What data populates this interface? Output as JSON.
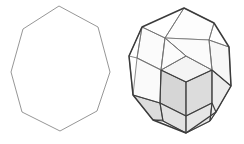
{
  "figure": {
    "background_color": "#ffffff",
    "width": 244,
    "height": 144,
    "panels": [
      {
        "id": "left-panel",
        "name": "octagon-outline",
        "label": "Regular octagon outline",
        "type": "polygon-2d",
        "sides": 8,
        "stroke_color": "#8a8a8a",
        "fill_color": "none",
        "stroke_width": 0.9,
        "vertices": [
          [
            59,
            6
          ],
          [
            98,
            27
          ],
          [
            110,
            72
          ],
          [
            97,
            111
          ],
          [
            60,
            131
          ],
          [
            22,
            112
          ],
          [
            11,
            72
          ],
          [
            23,
            29
          ]
        ]
      },
      {
        "id": "right-panel",
        "name": "zonohedron-3d",
        "label": "Shaded zonohedron wireframe",
        "type": "polyhedron-3d",
        "silhouette_color": "#3b3b3b",
        "edge_color": "#3d3d3d",
        "hidden_edge_color": "#9d9d9d",
        "shaded_face_color": "#d9d9d9",
        "light_face_color": "#f2f2f2",
        "white_face_color": "#ffffff",
        "silhouette": [
          [
            184,
            8
          ],
          [
            214,
            23
          ],
          [
            229,
            47
          ],
          [
            231,
            86
          ],
          [
            216,
            112
          ],
          [
            186,
            133
          ],
          [
            153,
            120
          ],
          [
            133,
            95
          ],
          [
            129,
            56
          ],
          [
            142,
            27
          ]
        ],
        "shaded_faces": [
          {
            "name": "front-lower-rhomb",
            "tone": "#d6d6d6",
            "points": [
              [
                161,
                70
              ],
              [
                186,
                82
              ],
              [
                186,
                116
              ],
              [
                160,
                103
              ]
            ]
          },
          {
            "name": "front-right-rhomb",
            "tone": "#dcdcdc",
            "points": [
              [
                186,
                82
              ],
              [
                212,
                70
              ],
              [
                212,
                103
              ],
              [
                186,
                116
              ]
            ]
          },
          {
            "name": "left-lower-quad",
            "tone": "#dcdcdc",
            "points": [
              [
                133,
                95
              ],
              [
                160,
                103
              ],
              [
                163,
                120
              ],
              [
                153,
                120
              ]
            ]
          },
          {
            "name": "bottom-left-rhomb",
            "tone": "#e2e2e2",
            "points": [
              [
                160,
                103
              ],
              [
                186,
                116
              ],
              [
                186,
                133
              ],
              [
                163,
                121
              ]
            ]
          },
          {
            "name": "bottom-right-rhomb",
            "tone": "#e6e6e6",
            "points": [
              [
                186,
                116
              ],
              [
                212,
                103
              ],
              [
                210,
                121
              ],
              [
                186,
                133
              ]
            ]
          },
          {
            "name": "right-lower-quad",
            "tone": "#ececec",
            "points": [
              [
                212,
                70
              ],
              [
                231,
                86
              ],
              [
                216,
                112
              ],
              [
                210,
                121
              ],
              [
                212,
                103
              ]
            ]
          },
          {
            "name": "upper-mid-face",
            "tone": "#f4f4f4",
            "points": [
              [
                161,
                70
              ],
              [
                186,
                56
              ],
              [
                212,
                70
              ],
              [
                186,
                82
              ]
            ]
          },
          {
            "name": "top-left-face",
            "tone": "#fbfbfb",
            "points": [
              [
                142,
                27
              ],
              [
                165,
                38
              ],
              [
                161,
                70
              ],
              [
                137,
                58
              ]
            ]
          },
          {
            "name": "top-cap-face",
            "tone": "#fdfdfd",
            "points": [
              [
                184,
                8
              ],
              [
                214,
                23
              ],
              [
                209,
                40
              ],
              [
                165,
                38
              ]
            ]
          },
          {
            "name": "top-right-face",
            "tone": "#f7f7f7",
            "points": [
              [
                209,
                40
              ],
              [
                229,
                47
              ],
              [
                231,
                86
              ],
              [
                212,
                70
              ]
            ]
          },
          {
            "name": "mid-left-face",
            "tone": "#fafafa",
            "points": [
              [
                137,
                58
              ],
              [
                161,
                70
              ],
              [
                160,
                103
              ],
              [
                133,
                95
              ]
            ]
          },
          {
            "name": "mid-top-face",
            "tone": "#fbfbfb",
            "points": [
              [
                165,
                38
              ],
              [
                209,
                40
              ],
              [
                212,
                70
              ],
              [
                186,
                56
              ]
            ]
          },
          {
            "name": "inner-left-face",
            "tone": "#fcfcfc",
            "points": [
              [
                165,
                38
              ],
              [
                186,
                56
              ],
              [
                161,
                70
              ]
            ]
          }
        ],
        "hidden_edges": [
          [
            [
              142,
              27
            ],
            [
              129,
              56
            ]
          ],
          [
            [
              129,
              56
            ],
            [
              137,
              58
            ]
          ],
          [
            [
              129,
              56
            ],
            [
              133,
              95
            ]
          ],
          [
            [
              137,
              58
            ],
            [
              161,
              70
            ]
          ],
          [
            [
              142,
              27
            ],
            [
              137,
              58
            ]
          ],
          [
            [
              165,
              38
            ],
            [
              161,
              70
            ]
          ],
          [
            [
              186,
              56
            ],
            [
              161,
              70
            ]
          ],
          [
            [
              186,
              56
            ],
            [
              212,
              70
            ]
          ],
          [
            [
              209,
              40
            ],
            [
              212,
              70
            ]
          ],
          [
            [
              165,
              38
            ],
            [
              186,
              56
            ]
          ],
          [
            [
              184,
              8
            ],
            [
              165,
              38
            ]
          ],
          [
            [
              214,
              23
            ],
            [
              209,
              40
            ]
          ],
          [
            [
              229,
              47
            ],
            [
              209,
              40
            ]
          ],
          [
            [
              142,
              27
            ],
            [
              165,
              38
            ]
          ],
          [
            [
              153,
              120
            ],
            [
              163,
              120
            ]
          ]
        ],
        "visible_edges": [
          [
            [
              161,
              70
            ],
            [
              186,
              82
            ]
          ],
          [
            [
              186,
              82
            ],
            [
              212,
              70
            ]
          ],
          [
            [
              186,
              82
            ],
            [
              186,
              116
            ]
          ],
          [
            [
              161,
              70
            ],
            [
              160,
              103
            ]
          ],
          [
            [
              212,
              70
            ],
            [
              212,
              103
            ]
          ],
          [
            [
              160,
              103
            ],
            [
              186,
              116
            ]
          ],
          [
            [
              186,
              116
            ],
            [
              212,
              103
            ]
          ],
          [
            [
              160,
              103
            ],
            [
              163,
              121
            ]
          ],
          [
            [
              163,
              121
            ],
            [
              186,
              133
            ]
          ],
          [
            [
              186,
              116
            ],
            [
              186,
              133
            ]
          ],
          [
            [
              212,
              103
            ],
            [
              210,
              121
            ]
          ],
          [
            [
              210,
              121
            ],
            [
              186,
              133
            ]
          ],
          [
            [
              133,
              95
            ],
            [
              160,
              103
            ]
          ],
          [
            [
              153,
              120
            ],
            [
              163,
              121
            ]
          ],
          [
            [
              212,
              103
            ],
            [
              216,
              112
            ]
          ],
          [
            [
              210,
              121
            ],
            [
              216,
              112
            ]
          ],
          [
            [
              231,
              86
            ],
            [
              212,
              70
            ]
          ]
        ]
      }
    ]
  }
}
